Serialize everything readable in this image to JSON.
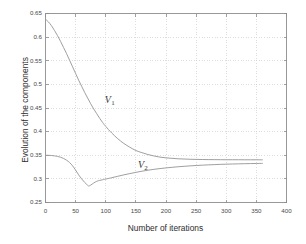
{
  "chart_data": {
    "type": "line",
    "title": "",
    "xlabel": "Number of iterations",
    "ylabel": "Evolution of the components",
    "xlim": [
      0,
      400
    ],
    "ylim": [
      0.25,
      0.65
    ],
    "xticks": [
      0,
      50,
      100,
      150,
      200,
      250,
      300,
      350,
      400
    ],
    "xtick_labels": [
      "0",
      "50",
      "100",
      "150",
      "200",
      "250",
      "300",
      "350",
      "400"
    ],
    "yticks": [
      0.25,
      0.3,
      0.35,
      0.4,
      0.45,
      0.5,
      0.55,
      0.6,
      0.65
    ],
    "ytick_labels": [
      "0.25",
      "0.3",
      "0.35",
      "0.4",
      "0.45",
      "0.5",
      "0.55",
      "0.6",
      "0.65"
    ],
    "grid": true,
    "legend": "inline-annotations",
    "line_color": "#9a9a9a",
    "axis_color": "#8d8d8d",
    "grid_color": "#cfcfcf",
    "background": "#ffffff",
    "annotations": [
      {
        "name": "V1",
        "text": "V",
        "sub": "1",
        "x": 105,
        "y": 0.465
      },
      {
        "name": "V2",
        "text": "V",
        "sub": "2",
        "x": 160,
        "y": 0.327
      }
    ],
    "series": [
      {
        "name": "V1",
        "label": "V₁",
        "x": [
          0,
          5,
          10,
          15,
          20,
          25,
          30,
          35,
          40,
          45,
          50,
          55,
          60,
          65,
          70,
          75,
          80,
          85,
          90,
          95,
          100,
          110,
          120,
          130,
          140,
          150,
          160,
          170,
          180,
          190,
          200,
          210,
          220,
          230,
          240,
          250,
          260,
          270,
          280,
          290,
          300,
          310,
          320,
          330,
          340,
          350,
          360
        ],
        "y": [
          0.638,
          0.632,
          0.624,
          0.614,
          0.603,
          0.591,
          0.578,
          0.565,
          0.551,
          0.537,
          0.523,
          0.509,
          0.496,
          0.483,
          0.471,
          0.459,
          0.448,
          0.438,
          0.428,
          0.419,
          0.411,
          0.397,
          0.385,
          0.375,
          0.367,
          0.36,
          0.3555,
          0.3515,
          0.3485,
          0.346,
          0.3445,
          0.3435,
          0.3425,
          0.342,
          0.3415,
          0.3412,
          0.341,
          0.3408,
          0.3407,
          0.3406,
          0.3405,
          0.3405,
          0.3405,
          0.3404,
          0.3404,
          0.3404,
          0.3403
        ]
      },
      {
        "name": "V2",
        "label": "V₂",
        "x": [
          0,
          5,
          10,
          15,
          20,
          25,
          30,
          35,
          40,
          45,
          50,
          55,
          60,
          65,
          70,
          72,
          75,
          80,
          85,
          90,
          95,
          100,
          110,
          120,
          130,
          140,
          150,
          160,
          170,
          180,
          190,
          200,
          210,
          220,
          230,
          240,
          250,
          260,
          270,
          280,
          290,
          300,
          310,
          320,
          330,
          340,
          350,
          360
        ],
        "y": [
          0.35,
          0.3498,
          0.3494,
          0.3487,
          0.3476,
          0.3458,
          0.3432,
          0.3395,
          0.3345,
          0.3275,
          0.3185,
          0.3085,
          0.3,
          0.2925,
          0.2865,
          0.285,
          0.2868,
          0.2912,
          0.2948,
          0.2968,
          0.2982,
          0.2996,
          0.3025,
          0.3055,
          0.3085,
          0.3112,
          0.3138,
          0.3162,
          0.3183,
          0.3202,
          0.3218,
          0.3232,
          0.3245,
          0.3256,
          0.3266,
          0.3275,
          0.3283,
          0.329,
          0.3296,
          0.3302,
          0.3307,
          0.3311,
          0.3315,
          0.3318,
          0.3321,
          0.3324,
          0.3326,
          0.3328
        ]
      }
    ]
  }
}
